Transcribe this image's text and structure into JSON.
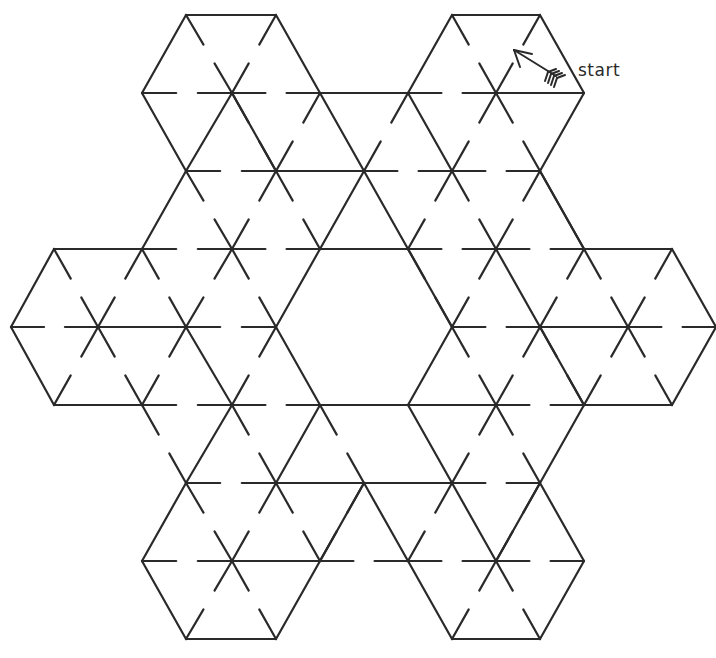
{
  "start_label": "start",
  "stroke_color": "#2a2a2a",
  "grid": {
    "dx": 88,
    "dy": 78,
    "x0": 11,
    "y0": 15
  },
  "solid_walls": [
    [
      [
        186,
        15
      ],
      [
        276,
        15
      ]
    ],
    [
      [
        452,
        15
      ],
      [
        540,
        15
      ]
    ],
    [
      [
        186,
        15
      ],
      [
        142,
        93
      ]
    ],
    [
      [
        142,
        93
      ],
      [
        186,
        171
      ]
    ],
    [
      [
        276,
        15
      ],
      [
        320,
        93
      ]
    ],
    [
      [
        452,
        15
      ],
      [
        408,
        93
      ]
    ],
    [
      [
        540,
        15
      ],
      [
        584,
        93
      ]
    ],
    [
      [
        584,
        93
      ],
      [
        540,
        171
      ]
    ],
    [
      [
        320,
        93
      ],
      [
        408,
        93
      ]
    ],
    [
      [
        496,
        93
      ],
      [
        584,
        93
      ]
    ],
    [
      [
        186,
        171
      ],
      [
        232,
        93
      ]
    ],
    [
      [
        232,
        93
      ],
      [
        276,
        171
      ]
    ],
    [
      [
        276,
        171
      ],
      [
        364,
        171
      ]
    ],
    [
      [
        320,
        93
      ],
      [
        364,
        171
      ]
    ],
    [
      [
        364,
        171
      ],
      [
        320,
        249
      ]
    ],
    [
      [
        408,
        93
      ],
      [
        452,
        171
      ]
    ],
    [
      [
        540,
        171
      ],
      [
        584,
        249
      ]
    ],
    [
      [
        186,
        171
      ],
      [
        142,
        249
      ]
    ],
    [
      [
        320,
        249
      ],
      [
        408,
        249
      ]
    ],
    [
      [
        408,
        249
      ],
      [
        364,
        171
      ]
    ],
    [
      [
        54,
        249
      ],
      [
        142,
        249
      ]
    ],
    [
      [
        54,
        249
      ],
      [
        11,
        327
      ]
    ],
    [
      [
        11,
        327
      ],
      [
        54,
        405
      ]
    ],
    [
      [
        54,
        405
      ],
      [
        142,
        405
      ]
    ],
    [
      [
        98,
        327
      ],
      [
        186,
        327
      ]
    ],
    [
      [
        186,
        327
      ],
      [
        232,
        405
      ]
    ],
    [
      [
        320,
        249
      ],
      [
        276,
        327
      ]
    ],
    [
      [
        276,
        327
      ],
      [
        320,
        405
      ]
    ],
    [
      [
        320,
        405
      ],
      [
        408,
        405
      ]
    ],
    [
      [
        408,
        405
      ],
      [
        452,
        327
      ]
    ],
    [
      [
        452,
        327
      ],
      [
        408,
        249
      ]
    ],
    [
      [
        496,
        249
      ],
      [
        584,
        405
      ]
    ],
    [
      [
        540,
        327
      ],
      [
        628,
        327
      ]
    ],
    [
      [
        584,
        249
      ],
      [
        672,
        249
      ]
    ],
    [
      [
        672,
        249
      ],
      [
        716,
        327
      ]
    ],
    [
      [
        716,
        327
      ],
      [
        672,
        405
      ]
    ],
    [
      [
        584,
        405
      ],
      [
        672,
        405
      ]
    ],
    [
      [
        584,
        405
      ],
      [
        540,
        483
      ]
    ],
    [
      [
        584,
        249
      ],
      [
        540,
        171
      ]
    ],
    [
      [
        232,
        405
      ],
      [
        186,
        483
      ]
    ],
    [
      [
        186,
        483
      ],
      [
        142,
        561
      ]
    ],
    [
      [
        142,
        561
      ],
      [
        186,
        639
      ]
    ],
    [
      [
        186,
        639
      ],
      [
        276,
        639
      ]
    ],
    [
      [
        276,
        639
      ],
      [
        364,
        483
      ]
    ],
    [
      [
        320,
        405
      ],
      [
        276,
        483
      ]
    ],
    [
      [
        276,
        483
      ],
      [
        364,
        483
      ]
    ],
    [
      [
        364,
        483
      ],
      [
        452,
        483
      ]
    ],
    [
      [
        408,
        405
      ],
      [
        496,
        405
      ]
    ],
    [
      [
        408,
        405
      ],
      [
        452,
        483
      ]
    ],
    [
      [
        452,
        483
      ],
      [
        496,
        561
      ]
    ],
    [
      [
        496,
        561
      ],
      [
        540,
        483
      ]
    ],
    [
      [
        540,
        483
      ],
      [
        584,
        561
      ]
    ],
    [
      [
        584,
        561
      ],
      [
        540,
        639
      ]
    ],
    [
      [
        452,
        639
      ],
      [
        540,
        639
      ]
    ],
    [
      [
        452,
        639
      ],
      [
        408,
        561
      ]
    ],
    [
      [
        364,
        483
      ],
      [
        408,
        561
      ]
    ],
    [
      [
        232,
        561
      ],
      [
        320,
        561
      ]
    ]
  ],
  "gapped_walls": [
    [
      [
        142,
        93
      ],
      [
        232,
        93
      ]
    ],
    [
      [
        232,
        93
      ],
      [
        320,
        93
      ]
    ],
    [
      [
        408,
        93
      ],
      [
        496,
        93
      ]
    ],
    [
      [
        186,
        15
      ],
      [
        232,
        93
      ]
    ],
    [
      [
        276,
        15
      ],
      [
        232,
        93
      ]
    ],
    [
      [
        452,
        15
      ],
      [
        496,
        93
      ]
    ],
    [
      [
        540,
        15
      ],
      [
        496,
        93
      ]
    ],
    [
      [
        232,
        93
      ],
      [
        276,
        171
      ]
    ],
    [
      [
        320,
        93
      ],
      [
        276,
        171
      ]
    ],
    [
      [
        408,
        93
      ],
      [
        364,
        171
      ]
    ],
    [
      [
        496,
        93
      ],
      [
        452,
        171
      ]
    ],
    [
      [
        496,
        93
      ],
      [
        540,
        171
      ]
    ],
    [
      [
        186,
        171
      ],
      [
        276,
        171
      ]
    ],
    [
      [
        364,
        171
      ],
      [
        452,
        171
      ]
    ],
    [
      [
        452,
        171
      ],
      [
        540,
        171
      ]
    ],
    [
      [
        186,
        171
      ],
      [
        232,
        249
      ]
    ],
    [
      [
        276,
        171
      ],
      [
        232,
        249
      ]
    ],
    [
      [
        276,
        171
      ],
      [
        320,
        249
      ]
    ],
    [
      [
        452,
        171
      ],
      [
        408,
        249
      ]
    ],
    [
      [
        452,
        171
      ],
      [
        496,
        249
      ]
    ],
    [
      [
        540,
        171
      ],
      [
        496,
        249
      ]
    ],
    [
      [
        142,
        249
      ],
      [
        232,
        249
      ]
    ],
    [
      [
        232,
        249
      ],
      [
        320,
        249
      ]
    ],
    [
      [
        408,
        249
      ],
      [
        496,
        249
      ]
    ],
    [
      [
        496,
        249
      ],
      [
        584,
        249
      ]
    ],
    [
      [
        54,
        249
      ],
      [
        98,
        327
      ]
    ],
    [
      [
        142,
        249
      ],
      [
        98,
        327
      ]
    ],
    [
      [
        142,
        249
      ],
      [
        186,
        327
      ]
    ],
    [
      [
        232,
        249
      ],
      [
        186,
        327
      ]
    ],
    [
      [
        232,
        249
      ],
      [
        276,
        327
      ]
    ],
    [
      [
        408,
        249
      ],
      [
        452,
        327
      ]
    ],
    [
      [
        496,
        249
      ],
      [
        452,
        327
      ]
    ],
    [
      [
        584,
        249
      ],
      [
        540,
        327
      ]
    ],
    [
      [
        584,
        249
      ],
      [
        628,
        327
      ]
    ],
    [
      [
        672,
        249
      ],
      [
        628,
        327
      ]
    ],
    [
      [
        11,
        327
      ],
      [
        98,
        327
      ]
    ],
    [
      [
        186,
        327
      ],
      [
        276,
        327
      ]
    ],
    [
      [
        452,
        327
      ],
      [
        540,
        327
      ]
    ],
    [
      [
        628,
        327
      ],
      [
        716,
        327
      ]
    ],
    [
      [
        98,
        327
      ],
      [
        54,
        405
      ]
    ],
    [
      [
        98,
        327
      ],
      [
        142,
        405
      ]
    ],
    [
      [
        186,
        327
      ],
      [
        142,
        405
      ]
    ],
    [
      [
        276,
        327
      ],
      [
        232,
        405
      ]
    ],
    [
      [
        452,
        327
      ],
      [
        496,
        405
      ]
    ],
    [
      [
        540,
        327
      ],
      [
        496,
        405
      ]
    ],
    [
      [
        540,
        327
      ],
      [
        584,
        405
      ]
    ],
    [
      [
        628,
        327
      ],
      [
        584,
        405
      ]
    ],
    [
      [
        628,
        327
      ],
      [
        672,
        405
      ]
    ],
    [
      [
        142,
        405
      ],
      [
        232,
        405
      ]
    ],
    [
      [
        232,
        405
      ],
      [
        320,
        405
      ]
    ],
    [
      [
        496,
        405
      ],
      [
        584,
        405
      ]
    ],
    [
      [
        142,
        405
      ],
      [
        186,
        483
      ]
    ],
    [
      [
        232,
        405
      ],
      [
        276,
        483
      ]
    ],
    [
      [
        320,
        405
      ],
      [
        364,
        483
      ]
    ],
    [
      [
        496,
        405
      ],
      [
        452,
        483
      ]
    ],
    [
      [
        496,
        405
      ],
      [
        540,
        483
      ]
    ],
    [
      [
        186,
        483
      ],
      [
        276,
        483
      ]
    ],
    [
      [
        452,
        483
      ],
      [
        540,
        483
      ]
    ],
    [
      [
        186,
        483
      ],
      [
        232,
        561
      ]
    ],
    [
      [
        276,
        483
      ],
      [
        232,
        561
      ]
    ],
    [
      [
        276,
        483
      ],
      [
        320,
        561
      ]
    ],
    [
      [
        364,
        483
      ],
      [
        320,
        561
      ]
    ],
    [
      [
        452,
        483
      ],
      [
        408,
        561
      ]
    ],
    [
      [
        540,
        483
      ],
      [
        496,
        561
      ]
    ],
    [
      [
        142,
        561
      ],
      [
        232,
        561
      ]
    ],
    [
      [
        320,
        561
      ],
      [
        408,
        561
      ]
    ],
    [
      [
        408,
        561
      ],
      [
        496,
        561
      ]
    ],
    [
      [
        496,
        561
      ],
      [
        584,
        561
      ]
    ],
    [
      [
        232,
        561
      ],
      [
        186,
        639
      ]
    ],
    [
      [
        232,
        561
      ],
      [
        276,
        639
      ]
    ],
    [
      [
        496,
        561
      ],
      [
        452,
        639
      ]
    ],
    [
      [
        496,
        561
      ],
      [
        540,
        639
      ]
    ]
  ],
  "arrow": {
    "tail": [
      556,
      76
    ],
    "head": [
      514,
      50
    ]
  }
}
